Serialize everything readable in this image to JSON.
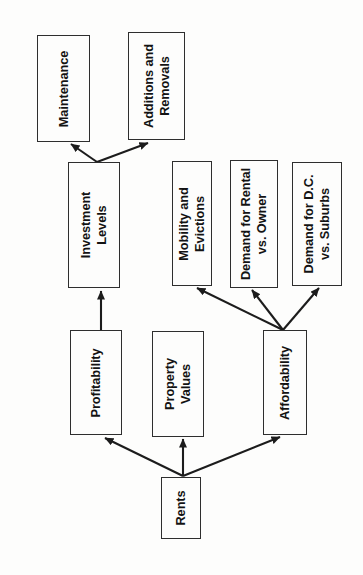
{
  "diagram": {
    "colors": {
      "background": "#fdfdfc",
      "line": "#1c1c1c",
      "box_border": "#2e2e2e",
      "text": "#131313"
    },
    "text_orientation": "rotated-90-ccw",
    "nodes": [
      {
        "id": "maintenance",
        "label": "Maintenance"
      },
      {
        "id": "additions-and-removals",
        "label": "Additions and\nRemovals"
      },
      {
        "id": "investment-levels",
        "label": "Investment\nLevels"
      },
      {
        "id": "mobility-and-evictions",
        "label": "Mobility and\nEvictions"
      },
      {
        "id": "demand-for-rental-vs-owner",
        "label": "Demand for Rental\nvs. Owner"
      },
      {
        "id": "demand-for-dc-vs-suburbs",
        "label": "Demand for D.C.\nvs. Suburbs"
      },
      {
        "id": "profitability",
        "label": "Profitability"
      },
      {
        "id": "property-values",
        "label": "Property\nValues"
      },
      {
        "id": "affordability",
        "label": "Affordability"
      },
      {
        "id": "rents",
        "label": "Rents"
      }
    ],
    "edges": [
      {
        "from": "investment-levels",
        "to": "maintenance"
      },
      {
        "from": "investment-levels",
        "to": "additions-and-removals"
      },
      {
        "from": "profitability",
        "to": "investment-levels"
      },
      {
        "from": "rents",
        "to": "profitability"
      },
      {
        "from": "rents",
        "to": "property-values"
      },
      {
        "from": "rents",
        "to": "affordability"
      },
      {
        "from": "affordability",
        "to": "mobility-and-evictions"
      },
      {
        "from": "affordability",
        "to": "demand-for-rental-vs-owner"
      },
      {
        "from": "affordability",
        "to": "demand-for-dc-vs-suburbs"
      }
    ]
  }
}
